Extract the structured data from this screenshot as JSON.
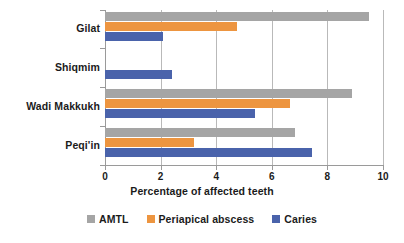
{
  "chart_data": {
    "type": "bar",
    "orientation": "horizontal",
    "title": "",
    "xlabel": "Percentage of affected teeth",
    "ylabel": "",
    "xlim": [
      0,
      10
    ],
    "xticks": [
      0,
      2,
      4,
      6,
      8,
      10
    ],
    "xtick_labels": [
      "0",
      "2",
      "4",
      "6",
      "8",
      "10"
    ],
    "grid": true,
    "legend_position": "bottom",
    "categories": [
      "Gilat",
      "Shiqmim",
      "Wadi Makkukh",
      "Peqi'in"
    ],
    "series": [
      {
        "name": "AMTL",
        "color": "#a5a5a5",
        "values": [
          9.5,
          0,
          8.9,
          6.85
        ]
      },
      {
        "name": "Periapical abscess",
        "color": "#ed9540",
        "values": [
          4.75,
          0,
          6.65,
          3.2
        ]
      },
      {
        "name": "Caries",
        "color": "#4a63ab",
        "values": [
          2.1,
          2.4,
          5.4,
          7.45
        ]
      }
    ]
  },
  "axis": {
    "x_title": "Percentage of affected teeth"
  },
  "legend": {
    "items": [
      {
        "label": "AMTL",
        "color": "#a5a5a5"
      },
      {
        "label": "Periapical abscess",
        "color": "#ed9540"
      },
      {
        "label": "Caries",
        "color": "#4a63ab"
      }
    ]
  },
  "categories": {
    "items": [
      {
        "label": "Gilat"
      },
      {
        "label": "Shiqmim"
      },
      {
        "label": "Wadi Makkukh"
      },
      {
        "label": "Peqi'in"
      }
    ]
  },
  "ticks": {
    "labels": [
      "0",
      "2",
      "4",
      "6",
      "8",
      "10"
    ]
  }
}
